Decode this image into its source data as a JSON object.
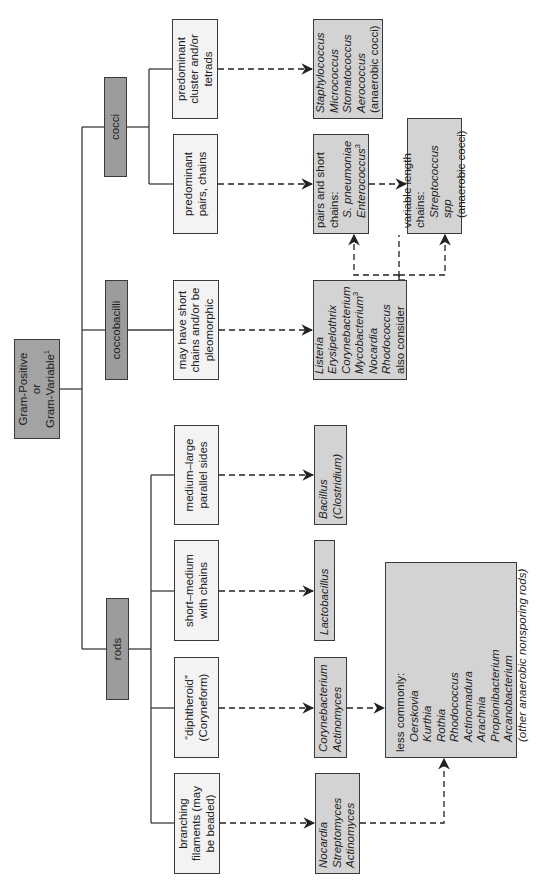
{
  "diagram": {
    "root": {
      "line1": "Gram-Positive",
      "line2": "or",
      "line3": "Gram-Variable",
      "footnote": "1"
    },
    "categories": {
      "cocci": "cocci",
      "coccobacilli": "coccobacilli",
      "rods": "rods"
    },
    "descriptions": {
      "cluster": [
        "predominant",
        "cluster and/or",
        "tetrads"
      ],
      "pairs_chains": [
        "predominant",
        "pairs, chains"
      ],
      "may_have": [
        "may have short",
        "chains and/or be",
        "pleomorphic"
      ],
      "medium_large": [
        "medium–large",
        "parallel sides"
      ],
      "short_medium": [
        "short–medium",
        "with chains"
      ],
      "diphtheroid": [
        "“diphtheroid”",
        "(Coryneform)"
      ],
      "branching": [
        "branching",
        "filaments (may",
        "be beaded)"
      ]
    },
    "results": {
      "staph": [
        "Staphylococcus",
        "Micrococcus",
        "Stomatococcus",
        "Aerococcus",
        "(anaerobic cocci)"
      ],
      "pairs_short": {
        "line1": "pairs and short",
        "line2": "chains:",
        "line3": "S. pneumoniae",
        "line4": "Enterococcus",
        "footnote": "3"
      },
      "variable": {
        "line1": "variable length",
        "line2": "chains:",
        "line3": "Streptococcus spp",
        "line4": "(anaerobic cocci)"
      },
      "listeria": {
        "items": [
          "Listeria",
          "Erysipelothrix",
          "Corynebacterium",
          "Mycobacterium",
          "Nocardia",
          "Rhodococcus"
        ],
        "footnote": "3",
        "tail": "also consider"
      },
      "bacillus": [
        "Bacillus",
        "(Clostridium)"
      ],
      "lactobacillus": [
        "Lactobacillus"
      ],
      "corynebacterium": [
        "Corynebacterium",
        "Actinomyces"
      ],
      "nocardia": [
        "Nocardia",
        "Streptomyces",
        "Actinomyces"
      ],
      "less_commonly": {
        "header": "less commonly:",
        "items": [
          "Oerskovia",
          "Kurthia",
          "Rothia",
          "Rhodococcus",
          "Actinomadura",
          "Arachnia",
          "Propionibacterium",
          "Arcanobacterium",
          "(other anaerobic nonsporing rods)"
        ]
      }
    },
    "colors": {
      "category_fill": "#9c9c9c",
      "description_fill": "#f3f3f3",
      "result_fill": "#d3d3d3",
      "line": "#3a3a3a"
    }
  }
}
